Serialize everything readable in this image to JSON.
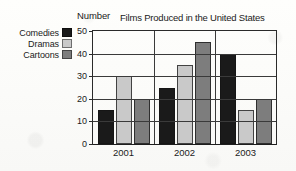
{
  "chart_data": {
    "type": "bar",
    "title": "Films Produced in the United States",
    "xlabel": "",
    "ylabel": "Number",
    "ylim": [
      0,
      50
    ],
    "ytick_step": 10,
    "yticks": [
      0,
      10,
      20,
      30,
      40,
      50
    ],
    "ytick_labels": [
      "0",
      "10",
      "20",
      "30",
      "40",
      "50"
    ],
    "categories": [
      "2001",
      "2002",
      "2003"
    ],
    "grid": "horizontal",
    "legend_position": "outside-left",
    "series": [
      {
        "name": "Comedies",
        "color": "#1a1a1a",
        "values": [
          15,
          25,
          40
        ]
      },
      {
        "name": "Dramas",
        "color": "#c9c9c9",
        "values": [
          30,
          35,
          15
        ]
      },
      {
        "name": "Cartoons",
        "color": "#7d7d7d",
        "values": [
          20,
          45,
          20
        ]
      }
    ]
  },
  "legend": {
    "items": [
      {
        "label": "Comedies",
        "color": "#1a1a1a"
      },
      {
        "label": "Dramas",
        "color": "#c9c9c9"
      },
      {
        "label": "Cartoons",
        "color": "#7d7d7d"
      }
    ]
  },
  "axis": {
    "y_label": "Number",
    "y_tick_labels": [
      "50",
      "40",
      "30",
      "20",
      "10",
      "0"
    ],
    "x_tick_labels": [
      "2001",
      "2002",
      "2003"
    ]
  },
  "header": {
    "title": "Films Produced in the United States"
  }
}
